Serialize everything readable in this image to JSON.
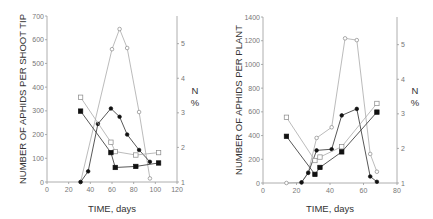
{
  "chart_data": [
    {
      "type": "line",
      "panel": "left",
      "xlabel": "TIME, days",
      "ylabel": "NUMBER OF APHIDS PER SHOOT TIP",
      "y2label": "N %",
      "xlim": [
        0,
        120
      ],
      "ylim": [
        0,
        700
      ],
      "y2lim": [
        1,
        5.8
      ],
      "x_ticks": [
        0,
        20,
        40,
        60,
        80,
        100,
        120
      ],
      "y_ticks": [
        0,
        100,
        200,
        300,
        400,
        500,
        600,
        700
      ],
      "y2_ticks": [
        1,
        2,
        3,
        4,
        5
      ],
      "series": [
        {
          "name": "aphids (open circles)",
          "marker": "open-circle",
          "axis": "left",
          "connected": true,
          "x": [
            31,
            60,
            67,
            74,
            85,
            95
          ],
          "values": [
            0,
            560,
            645,
            565,
            295,
            15
          ]
        },
        {
          "name": "aphids (filled circles)",
          "marker": "filled-circle",
          "axis": "left",
          "connected": true,
          "x": [
            31,
            38,
            47,
            59,
            67,
            74,
            85,
            95
          ],
          "values": [
            0,
            45,
            245,
            310,
            275,
            200,
            135,
            85
          ]
        },
        {
          "name": "N% (open squares)",
          "marker": "open-square",
          "axis": "right",
          "connected": true,
          "x": [
            31,
            59,
            63,
            82,
            103
          ],
          "values": [
            3.45,
            2.15,
            1.88,
            1.78,
            1.85
          ]
        },
        {
          "name": "N% (filled squares)",
          "marker": "filled-square",
          "axis": "right",
          "connected": true,
          "x": [
            31,
            59,
            63,
            82,
            103
          ],
          "values": [
            3.05,
            1.85,
            1.42,
            1.45,
            1.55
          ]
        }
      ]
    },
    {
      "type": "line",
      "panel": "right",
      "xlabel": "TIME, days",
      "ylabel": "NUMBER OF APHIDS PER PLANT",
      "y2label": "N %",
      "xlim": [
        0,
        80
      ],
      "ylim": [
        0,
        1400
      ],
      "y2lim": [
        1,
        5.8
      ],
      "x_ticks": [
        0,
        20,
        40,
        60,
        80
      ],
      "y_ticks": [
        0,
        200,
        400,
        600,
        800,
        1000,
        1200,
        1400
      ],
      "y2_ticks": [
        1,
        2,
        3,
        4,
        5
      ],
      "series": [
        {
          "name": "aphids (open circles)",
          "marker": "open-circle",
          "axis": "left",
          "connected": true,
          "x": [
            14,
            23,
            27,
            32,
            41,
            49,
            56,
            64,
            68
          ],
          "values": [
            0,
            5,
            90,
            380,
            470,
            1220,
            1205,
            245,
            95
          ]
        },
        {
          "name": "aphids (filled circles)",
          "marker": "filled-circle",
          "axis": "left",
          "connected": true,
          "x": [
            23,
            27,
            32,
            41,
            47,
            56,
            64,
            68
          ],
          "values": [
            5,
            85,
            275,
            285,
            570,
            625,
            55,
            10
          ]
        },
        {
          "name": "N% (open squares)",
          "marker": "open-square",
          "axis": "right",
          "connected": true,
          "x": [
            14,
            31,
            34,
            47,
            68
          ],
          "values": [
            2.9,
            1.65,
            1.75,
            2.05,
            3.3
          ]
        },
        {
          "name": "N% (filled squares)",
          "marker": "filled-square",
          "axis": "right",
          "connected": true,
          "x": [
            14,
            31,
            34,
            47,
            68
          ],
          "values": [
            2.35,
            1.25,
            1.45,
            1.9,
            3.05
          ]
        }
      ]
    }
  ],
  "panels": {
    "left": {
      "xlabel": "TIME, days",
      "ylabel": "NUMBER OF APHIDS PER SHOOT TIP",
      "y2label_top": "N",
      "y2label_bottom": "%"
    },
    "right": {
      "xlabel": "TIME, days",
      "ylabel": "NUMBER OF APHIDS PER PLANT",
      "y2label_top": "N",
      "y2label_bottom": "%"
    }
  }
}
